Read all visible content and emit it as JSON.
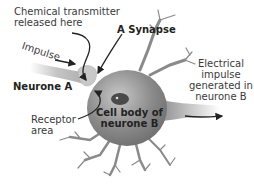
{
  "diagram": {
    "title": "A Synapse",
    "labels": {
      "chemical_transmitter_line1": "Chemical transmitter",
      "chemical_transmitter_line2": "released here",
      "impulse": "Impulse",
      "synapse": "A Synapse",
      "neurone_a": "Neurone A",
      "receptor_line1": "Receptor",
      "receptor_line2": "area",
      "cell_body_line1": "Cell body of",
      "cell_body_line2": "neurone B",
      "electrical_line1": "Electrical",
      "electrical_line2": "impulse",
      "electrical_line3": "generated in",
      "electrical_line4": "neurone B"
    },
    "colors": {
      "cell_body": "#8c8c8c",
      "axon": "#b4b4b4",
      "nucleus": "#4a4a4a",
      "arrow": "#222222"
    }
  }
}
